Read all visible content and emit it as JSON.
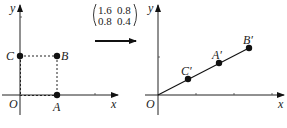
{
  "left_plot": {
    "axis_x": "x",
    "axis_y": "y",
    "origin": "O",
    "points": [
      {
        "name": "A",
        "x": 1,
        "y": 0
      },
      {
        "name": "B",
        "x": 1,
        "y": 1
      },
      {
        "name": "C",
        "x": 0,
        "y": 1
      }
    ]
  },
  "transform": {
    "matrix": [
      [
        "1.6",
        "0.8"
      ],
      [
        "0.8",
        "0.4"
      ]
    ]
  },
  "right_plot": {
    "axis_x": "x",
    "axis_y": "y",
    "origin": "O",
    "points": [
      {
        "name": "C′",
        "x": 0.8,
        "y": 0.4
      },
      {
        "name": "A′",
        "x": 1.6,
        "y": 0.8
      },
      {
        "name": "B′",
        "x": 2.4,
        "y": 1.2
      }
    ]
  },
  "colors": {
    "ink": "#111111"
  }
}
